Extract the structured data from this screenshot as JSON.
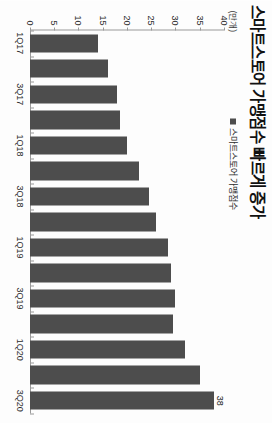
{
  "chart_data": {
    "type": "bar",
    "orientation": "vertical",
    "title": "스마트스토어 가맹점수 빠르게 증가",
    "unit_label": "(만개)",
    "legend": [
      {
        "name": "스마트스토어 가맹점수",
        "color": "#4d4d4d"
      }
    ],
    "legend_position": "top-center",
    "categories": [
      "1Q17",
      "2Q17",
      "3Q17",
      "4Q17",
      "1Q18",
      "2Q18",
      "3Q18",
      "4Q18",
      "1Q19",
      "2Q19",
      "3Q19",
      "4Q19",
      "1Q20",
      "2Q20",
      "3Q20"
    ],
    "tick_labels": [
      "1Q17",
      "",
      "3Q17",
      "",
      "1Q18",
      "",
      "3Q18",
      "",
      "1Q19",
      "",
      "3Q19",
      "",
      "1Q20",
      "",
      "3Q20"
    ],
    "values": [
      14,
      16,
      18,
      18.5,
      20,
      22.5,
      24.5,
      26,
      28.5,
      29,
      30,
      29.5,
      32,
      35,
      38
    ],
    "data_labels": [
      "",
      "",
      "",
      "",
      "",
      "",
      "",
      "",
      "",
      "",
      "",
      "",
      "",
      "",
      "38"
    ],
    "series": [
      {
        "name": "스마트스토어 가맹점수",
        "values": [
          14,
          16,
          18,
          18.5,
          20,
          22.5,
          24.5,
          26,
          28.5,
          29,
          30,
          29.5,
          32,
          35,
          38
        ]
      }
    ],
    "xlabel": "",
    "ylabel": "",
    "ylim": [
      0,
      40
    ],
    "yticks": [
      0,
      5,
      10,
      15,
      20,
      25,
      30,
      35,
      40
    ],
    "ytick_labels": [
      "0",
      "5",
      "10",
      "15",
      "20",
      "25",
      "30",
      "35",
      "40"
    ],
    "grid": false,
    "bar_color": "#4d4d4d",
    "axis_color": "#9a9a9a",
    "background": "#ffffff"
  }
}
